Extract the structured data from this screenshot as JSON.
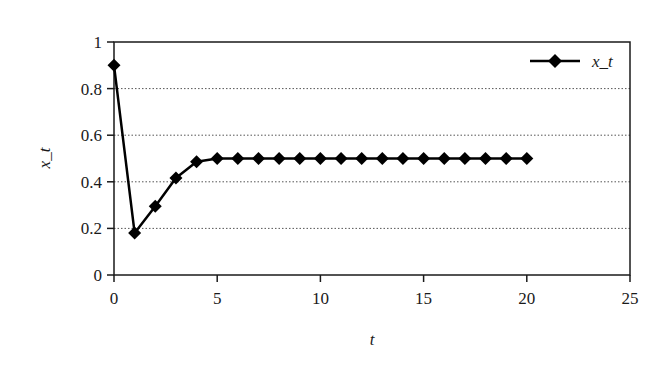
{
  "chart_data": {
    "type": "line",
    "title": "",
    "xlabel": "t",
    "ylabel": "x_t",
    "xlim": [
      0,
      25
    ],
    "ylim": [
      0,
      1
    ],
    "xticks": [
      0,
      5,
      10,
      15,
      20,
      25
    ],
    "yticks": [
      0,
      0.2,
      0.4,
      0.6,
      0.8,
      1
    ],
    "xtick_labels": [
      "0",
      "5",
      "10",
      "15",
      "20",
      "25"
    ],
    "ytick_labels": [
      "0",
      "0.2",
      "0.4",
      "0.6",
      "0.8",
      "1"
    ],
    "grid": {
      "horizontal": true,
      "vertical": false,
      "style": "dotted"
    },
    "legend": {
      "position": "upper right",
      "entries": [
        "x_t"
      ]
    },
    "series": [
      {
        "name": "x_t",
        "marker": "diamond",
        "color": "#000000",
        "x": [
          0,
          1,
          2,
          3,
          4,
          5,
          6,
          7,
          8,
          9,
          10,
          11,
          12,
          13,
          14,
          15,
          16,
          17,
          18,
          19,
          20
        ],
        "values": [
          0.9,
          0.18,
          0.2952,
          0.4161,
          0.4859,
          0.4996,
          0.5,
          0.5,
          0.5,
          0.5,
          0.5,
          0.5,
          0.5,
          0.5,
          0.5,
          0.5,
          0.5,
          0.5,
          0.5,
          0.5,
          0.5
        ]
      }
    ]
  },
  "colors": {
    "line": "#000000",
    "axis": "#1a1a1a",
    "grid": "#555555",
    "background": "#ffffff"
  }
}
